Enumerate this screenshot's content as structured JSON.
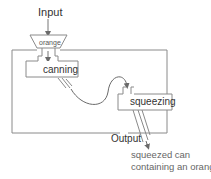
{
  "diagram": {
    "input_label": "Input",
    "funnel_label": "orange",
    "process_1": "canning",
    "process_2": "squeezing",
    "output_label": "Output",
    "result_line_1": "squeezed can",
    "result_line_2": "containing an orange"
  },
  "colors": {
    "stroke": "#8a8a8a",
    "text": "#333333",
    "result_text": "#666666"
  }
}
